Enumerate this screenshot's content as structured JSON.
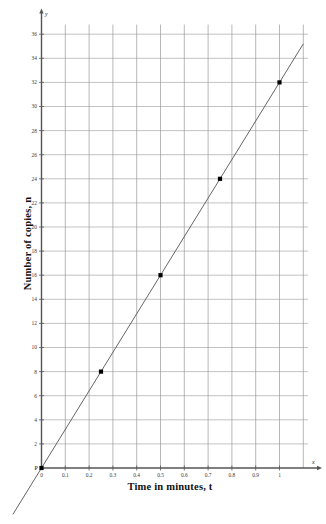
{
  "chart_data": {
    "type": "line",
    "title": "",
    "subtitle": "",
    "xlabel": "Time in minutes, t",
    "ylabel": "Number of copies, n",
    "x_axis_letter": "x",
    "y_axis_letter": "y",
    "origin_label": "P",
    "xlim": [
      0,
      1.12
    ],
    "ylim": [
      0,
      36.8
    ],
    "grid": true,
    "legend": "none",
    "x_ticks": [
      0,
      0.1,
      0.2,
      0.3,
      0.4,
      0.5,
      0.6,
      0.7,
      0.8,
      0.9,
      1
    ],
    "x_tick_labels": [
      "0",
      "0.1",
      "0.2",
      "0.3",
      "0.4",
      "0.5",
      "0.6",
      "0.7",
      "0.8",
      "0.9",
      "1"
    ],
    "y_ticks": [
      2,
      4,
      6,
      8,
      10,
      12,
      14,
      16,
      18,
      20,
      22,
      24,
      26,
      28,
      30,
      32,
      34,
      36
    ],
    "y_tick_labels": [
      "2",
      "4",
      "6",
      "8",
      "10",
      "12",
      "14",
      "16",
      "18",
      "20",
      "22",
      "24",
      "26",
      "28",
      "30",
      "32",
      "34",
      "36"
    ],
    "series": [
      {
        "name": "n = 32t",
        "type": "line",
        "x": [
          -0.12,
          1.1
        ],
        "y": [
          -3.84,
          35.2
        ],
        "color": "#555555"
      }
    ],
    "points": [
      {
        "label": "P",
        "x": 0,
        "y": 0
      },
      {
        "label": "",
        "x": 0.25,
        "y": 8
      },
      {
        "label": "",
        "x": 0.5,
        "y": 16
      },
      {
        "label": "",
        "x": 0.75,
        "y": 24
      },
      {
        "label": "",
        "x": 1,
        "y": 32
      }
    ],
    "point_color": "#000000",
    "grid_color": "#9a9a9a",
    "axis_color": "#555555"
  }
}
